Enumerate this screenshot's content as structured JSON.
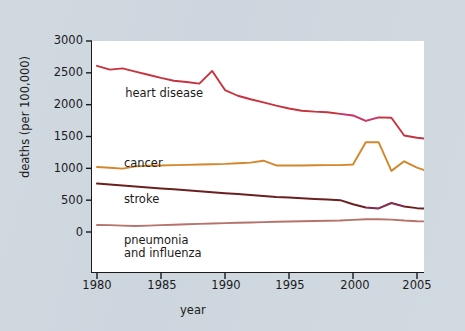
{
  "figure": {
    "background_color": "#ccd5dd",
    "plot_background_color": "#ffffff",
    "axis_color": "#1a1a1a"
  },
  "chart_data": {
    "type": "line",
    "title": "",
    "xlabel": "year",
    "ylabel": "deaths (per 100,000)",
    "xlim": [
      1980,
      2006
    ],
    "ylim": [
      0,
      3000
    ],
    "xticks": [
      1980,
      1985,
      1990,
      1995,
      2000,
      2005
    ],
    "yticks": [
      0,
      500,
      1000,
      1500,
      2000,
      2500,
      3000
    ],
    "grid": false,
    "legend_position": "inline-labels",
    "x": [
      1980,
      1981,
      1982,
      1983,
      1984,
      1985,
      1986,
      1987,
      1988,
      1989,
      1990,
      1991,
      1992,
      1993,
      1994,
      1995,
      1996,
      1997,
      1998,
      1999,
      2000,
      2001,
      2002,
      2003,
      2004,
      2005,
      2006
    ],
    "series": [
      {
        "name": "heart disease",
        "color": "#c8323c",
        "label_x": 1982.2,
        "label_y": 2270,
        "values": [
          2610,
          2550,
          2570,
          2520,
          2470,
          2420,
          2375,
          2355,
          2330,
          2530,
          2230,
          2140,
          2085,
          2035,
          1985,
          1940,
          1905,
          1890,
          1880,
          1855,
          1830,
          1745,
          1800,
          1795,
          1515,
          1480,
          1460
        ]
      },
      {
        "name": "cancer",
        "color": "#d4862a",
        "label_x": 1982.1,
        "label_y": 1185,
        "values": [
          1020,
          1010,
          995,
          1030,
          1040,
          1045,
          1050,
          1055,
          1060,
          1065,
          1070,
          1080,
          1090,
          1120,
          1045,
          1045,
          1045,
          1048,
          1050,
          1050,
          1060,
          1410,
          1410,
          960,
          1110,
          1010,
          945
        ]
      },
      {
        "name": "stroke",
        "color": "#6b2020",
        "label_x": 1982.1,
        "label_y": 620,
        "values": [
          760,
          745,
          730,
          715,
          700,
          685,
          670,
          655,
          640,
          625,
          610,
          595,
          580,
          565,
          550,
          540,
          530,
          520,
          512,
          500,
          435,
          385,
          370,
          455,
          400,
          375,
          365
        ]
      },
      {
        "name": "pneumonia and influenza",
        "color": "#b5736b",
        "label_line1": "pneumonia",
        "label_line2": "and influenza",
        "label_x": 1982.1,
        "label_y": -35,
        "values": [
          110,
          108,
          100,
          95,
          100,
          108,
          115,
          122,
          128,
          134,
          140,
          146,
          150,
          155,
          160,
          165,
          168,
          172,
          176,
          180,
          190,
          200,
          200,
          195,
          180,
          170,
          165
        ]
      }
    ]
  },
  "axis": {
    "ytick_labels": [
      "3000",
      "2500",
      "2000",
      "1500",
      "1000",
      "500",
      "0"
    ],
    "xtick_labels": [
      "1980",
      "1985",
      "1990",
      "1995",
      "2000",
      "2005"
    ]
  }
}
